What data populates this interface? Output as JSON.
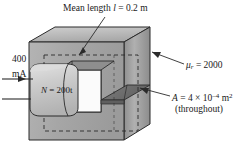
{
  "figure": {
    "background_color": "#ffffff",
    "core_colors": {
      "top_face": "#b8b8b8",
      "front_face": "#a8a8a8",
      "right_face": "#9a9a9a",
      "inner_shadow": "#8a8a8a",
      "window": "#fbfbfb",
      "gap_slab": "#6e6e6e",
      "coil": "#c9c9c9",
      "outline": "#2b2b2b"
    }
  },
  "labels": {
    "mean_length": "Mean length l = 0.2 m",
    "mean_length_prefix": "Mean length",
    "mean_length_symbol": "l",
    "mean_length_value": "= 0.2 m",
    "permeability_symbol": "μ",
    "permeability_sub": "r",
    "permeability_value": "= 2000",
    "area_symbol": "A",
    "area_value": "= 4 × 10",
    "area_exponent": "–4",
    "area_units": " m",
    "area_units_exponent": "2",
    "area_note": "(throughout)",
    "current_value": "400",
    "current_units": "mA",
    "coil_turns_symbol": "N",
    "coil_turns_value": "= 200t"
  },
  "annotations": {
    "mean_path_style": "dashed",
    "current_arrow_direction": "right",
    "leader_lines": 3
  }
}
